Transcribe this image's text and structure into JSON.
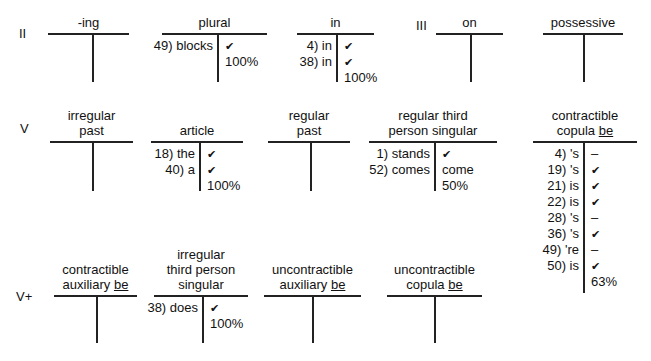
{
  "stages": [
    {
      "label": "II"
    },
    {
      "label": "III"
    },
    {
      "label": "V"
    },
    {
      "label": "V+"
    }
  ],
  "charts": [
    {
      "id": "ing",
      "title": [
        "-ing"
      ],
      "left": [],
      "right": []
    },
    {
      "id": "plural",
      "title": [
        "plural"
      ],
      "left": [
        "49) blocks"
      ],
      "right": [
        "✔",
        "100%"
      ]
    },
    {
      "id": "in",
      "title": [
        "in"
      ],
      "left": [
        "4) in",
        "38) in"
      ],
      "right": [
        "✔",
        "✔",
        "100%"
      ]
    },
    {
      "id": "on",
      "title": [
        "on"
      ],
      "left": [],
      "right": []
    },
    {
      "id": "possessive",
      "title": [
        "possessive"
      ],
      "left": [],
      "right": []
    },
    {
      "id": "irregular-past",
      "title": [
        "irregular",
        "past"
      ],
      "left": [],
      "right": []
    },
    {
      "id": "article",
      "title": [
        "article"
      ],
      "left": [
        "18) the",
        "40) a"
      ],
      "right": [
        "✔",
        "✔",
        "100%"
      ]
    },
    {
      "id": "regular-past",
      "title": [
        "regular",
        "past"
      ],
      "left": [],
      "right": []
    },
    {
      "id": "regular-third-person-singular",
      "title": [
        "regular third",
        "person singular"
      ],
      "left": [
        "1) stands",
        "52) comes"
      ],
      "right": [
        "✔",
        "come",
        "50%"
      ]
    },
    {
      "id": "contractible-copula-be",
      "title": [
        "contractible",
        "copula"
      ],
      "title_underlined": "be",
      "left": [
        "4) 's",
        "19) 's",
        "21) is",
        "22) is",
        "28) 's",
        "36) 's",
        "49) 're",
        "50) is"
      ],
      "right": [
        "–",
        "✔",
        "✔",
        "✔",
        "–",
        "✔",
        "–",
        "✔",
        "63%"
      ]
    },
    {
      "id": "contractible-auxiliary-be",
      "title": [
        "contractible",
        "auxiliary"
      ],
      "title_underlined": "be",
      "left": [],
      "right": []
    },
    {
      "id": "irregular-third-person-singular",
      "title": [
        "irregular",
        "third person",
        "singular"
      ],
      "left": [
        "38) does"
      ],
      "right": [
        "✔",
        "100%"
      ]
    },
    {
      "id": "uncontractible-auxiliary-be",
      "title": [
        "uncontractible",
        "auxiliary"
      ],
      "title_underlined": "be",
      "left": [],
      "right": []
    },
    {
      "id": "uncontractible-copula-be",
      "title": [
        "uncontractible",
        "copula"
      ],
      "title_underlined": "be",
      "left": [],
      "right": []
    }
  ]
}
